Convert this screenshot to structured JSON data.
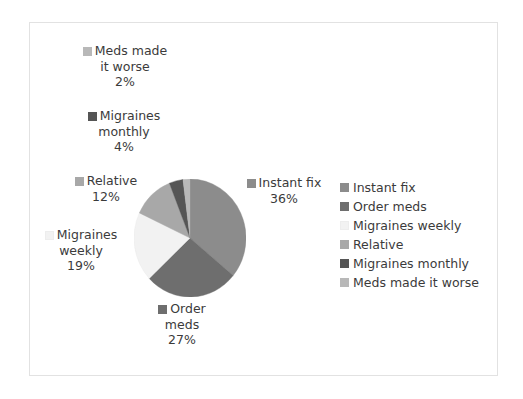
{
  "chart_data": {
    "type": "pie",
    "title": "",
    "subtitle": "",
    "xlabel": "",
    "ylabel": "",
    "legend_position": "right",
    "grid": false,
    "categories": [
      "Instant fix",
      "Order meds",
      "Migraines weekly",
      "Relative",
      "Migraines monthly",
      "Meds made it worse"
    ],
    "values": [
      36,
      27,
      19,
      12,
      4,
      2
    ],
    "value_unit": "%",
    "colors": [
      "#8c8c8c",
      "#6e6e6e",
      "#f2f2f2",
      "#a8a8a8",
      "#555555",
      "#b8b8b8"
    ],
    "slices": [
      {
        "label": "Instant fix",
        "value": 36,
        "value_text": "36%",
        "color": "#8c8c8c"
      },
      {
        "label": "Order meds",
        "value": 27,
        "value_text": "27%",
        "color": "#6e6e6e"
      },
      {
        "label": "Migraines weekly",
        "value": 19,
        "value_text": "19%",
        "color": "#f2f2f2"
      },
      {
        "label": "Relative",
        "value": 12,
        "value_text": "12%",
        "color": "#a8a8a8"
      },
      {
        "label": "Migraines monthly",
        "value": 4,
        "value_text": "4%",
        "color": "#555555"
      },
      {
        "label": "Meds made it worse",
        "value": 2,
        "value_text": "2%",
        "color": "#b8b8b8"
      }
    ]
  },
  "data_labels": {
    "meds_worse": {
      "line1": "Meds made",
      "line2": "it worse",
      "pct": "2%"
    },
    "mig_monthly": {
      "line1": "Migraines",
      "line2": "monthly",
      "pct": "4%"
    },
    "relative": {
      "line1": "Relative",
      "line2": "",
      "pct": "12%"
    },
    "mig_weekly": {
      "line1": "Migraines",
      "line2": "weekly",
      "pct": "19%"
    },
    "order_meds": {
      "line1": "Order",
      "line2": "meds",
      "pct": "27%"
    },
    "instant_fix": {
      "line1": "Instant fix",
      "line2": "",
      "pct": "36%"
    }
  },
  "legend": {
    "items": [
      {
        "label": "Instant fix",
        "color": "#8c8c8c"
      },
      {
        "label": "Order meds",
        "color": "#6e6e6e"
      },
      {
        "label": "Migraines weekly",
        "color": "#f2f2f2"
      },
      {
        "label": "Relative",
        "color": "#a8a8a8"
      },
      {
        "label": "Migraines monthly",
        "color": "#555555"
      },
      {
        "label": "Meds made it worse",
        "color": "#b8b8b8"
      }
    ]
  },
  "frame": {
    "border_color": "#e2e2e2",
    "background": "#ffffff"
  }
}
